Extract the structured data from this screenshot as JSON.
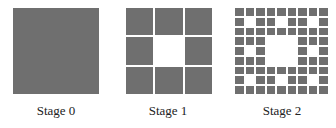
{
  "colors": {
    "fill": "#6f6f6f",
    "background": "#ffffff"
  },
  "stages": [
    {
      "label": "Stage 0",
      "grid": 1
    },
    {
      "label": "Stage 1",
      "grid": 3
    },
    {
      "label": "Stage 2",
      "grid": 9
    }
  ]
}
